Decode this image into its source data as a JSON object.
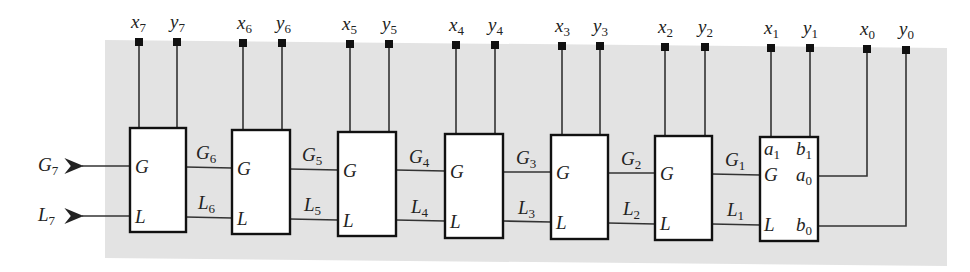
{
  "diagram": {
    "outputs": [
      {
        "name": "G",
        "sub": "7"
      },
      {
        "name": "L",
        "sub": "7"
      }
    ],
    "inputs": [
      {
        "x": {
          "name": "x",
          "sub": "7"
        },
        "y": {
          "name": "y",
          "sub": "7"
        }
      },
      {
        "x": {
          "name": "x",
          "sub": "6"
        },
        "y": {
          "name": "y",
          "sub": "6"
        }
      },
      {
        "x": {
          "name": "x",
          "sub": "5"
        },
        "y": {
          "name": "y",
          "sub": "5"
        }
      },
      {
        "x": {
          "name": "x",
          "sub": "4"
        },
        "y": {
          "name": "y",
          "sub": "4"
        }
      },
      {
        "x": {
          "name": "x",
          "sub": "3"
        },
        "y": {
          "name": "y",
          "sub": "3"
        }
      },
      {
        "x": {
          "name": "x",
          "sub": "2"
        },
        "y": {
          "name": "y",
          "sub": "2"
        }
      },
      {
        "x": {
          "name": "x",
          "sub": "1"
        },
        "y": {
          "name": "y",
          "sub": "1"
        }
      },
      {
        "x": {
          "name": "x",
          "sub": "0"
        },
        "y": {
          "name": "y",
          "sub": "0"
        }
      }
    ],
    "links": [
      {
        "g": {
          "name": "G",
          "sub": "6"
        },
        "l": {
          "name": "L",
          "sub": "6"
        }
      },
      {
        "g": {
          "name": "G",
          "sub": "5"
        },
        "l": {
          "name": "L",
          "sub": "5"
        }
      },
      {
        "g": {
          "name": "G",
          "sub": "4"
        },
        "l": {
          "name": "L",
          "sub": "4"
        }
      },
      {
        "g": {
          "name": "G",
          "sub": "3"
        },
        "l": {
          "name": "L",
          "sub": "3"
        }
      },
      {
        "g": {
          "name": "G",
          "sub": "2"
        },
        "l": {
          "name": "L",
          "sub": "2"
        }
      },
      {
        "g": {
          "name": "G",
          "sub": "1"
        },
        "l": {
          "name": "L",
          "sub": "1"
        }
      }
    ],
    "box_port_labels": {
      "g": "G",
      "l": "L"
    },
    "last_box_ports": {
      "a1": {
        "name": "a",
        "sub": "1"
      },
      "b1": {
        "name": "b",
        "sub": "1"
      },
      "a0": {
        "name": "a",
        "sub": "0"
      },
      "b0": {
        "name": "b",
        "sub": "0"
      },
      "g": "G",
      "l": "L"
    },
    "colors": {
      "background": "#e3e3e3",
      "line": "#222222",
      "box_fill": "#ffffff"
    }
  }
}
